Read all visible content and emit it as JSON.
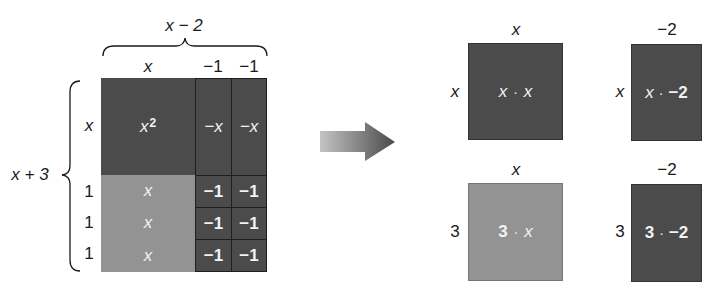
{
  "colors": {
    "dark_tile": "#4b4b4b",
    "light_tile": "#939393",
    "cell_border": "#1f1f1f",
    "text_dark": "#1a1a1a",
    "text_light": "#f2f2f2"
  },
  "left_model": {
    "top_brace_label": "x − 2",
    "column_labels": [
      "x",
      "−1",
      "−1"
    ],
    "side_brace_label": "x + 3",
    "row_labels": [
      "x",
      "1",
      "1",
      "1"
    ],
    "rows": [
      {
        "cells": [
          {
            "text": "x",
            "sup": "2",
            "shade": "dark"
          },
          {
            "text": "−x",
            "shade": "dark"
          },
          {
            "text": "−x",
            "shade": "dark"
          }
        ]
      },
      {
        "cells": [
          {
            "text": "x",
            "shade": "light"
          },
          {
            "text": "−1",
            "shade": "dark"
          },
          {
            "text": "−1",
            "shade": "dark"
          }
        ]
      },
      {
        "cells": [
          {
            "text": "x",
            "shade": "light"
          },
          {
            "text": "−1",
            "shade": "dark"
          },
          {
            "text": "−1",
            "shade": "dark"
          }
        ]
      },
      {
        "cells": [
          {
            "text": "x",
            "shade": "light"
          },
          {
            "text": "−1",
            "shade": "dark"
          },
          {
            "text": "−1",
            "shade": "dark"
          }
        ]
      }
    ]
  },
  "arrow": {
    "direction": "right"
  },
  "right_model": {
    "boxes": [
      {
        "top_label": "x",
        "side_label": "x",
        "product_a": "x",
        "dot": "·",
        "product_b": "x",
        "shade": "dark"
      },
      {
        "top_label": "−2",
        "side_label": "x",
        "product_a": "x",
        "dot": "·",
        "product_b": "−2",
        "shade": "dark"
      },
      {
        "top_label": "x",
        "side_label": "3",
        "product_a": "3",
        "dot": "·",
        "product_b": "x",
        "shade": "light"
      },
      {
        "top_label": "−2",
        "side_label": "3",
        "product_a": "3",
        "dot": "·",
        "product_b": "−2",
        "shade": "dark"
      }
    ]
  }
}
